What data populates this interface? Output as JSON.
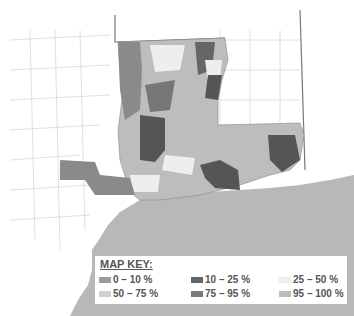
{
  "map": {
    "legend": {
      "title": "MAP KEY:",
      "items": [
        {
          "label": "0 – 10 %",
          "color": "#9a9a9a"
        },
        {
          "label": "10 – 25 %",
          "color": "#666666"
        },
        {
          "label": "25 – 50 %",
          "color": "#eeeeee"
        },
        {
          "label": "50 – 75 %",
          "color": "#cfcfcf"
        },
        {
          "label": "75 – 95 %",
          "color": "#7a7a7a"
        },
        {
          "label": "95 – 100 %",
          "color": "#bdbdbd"
        }
      ]
    },
    "colors": {
      "water": "#b8b8b8",
      "land_background": "#ffffff",
      "county_lines": "#d8d8d8",
      "state_border": "#777777"
    }
  }
}
